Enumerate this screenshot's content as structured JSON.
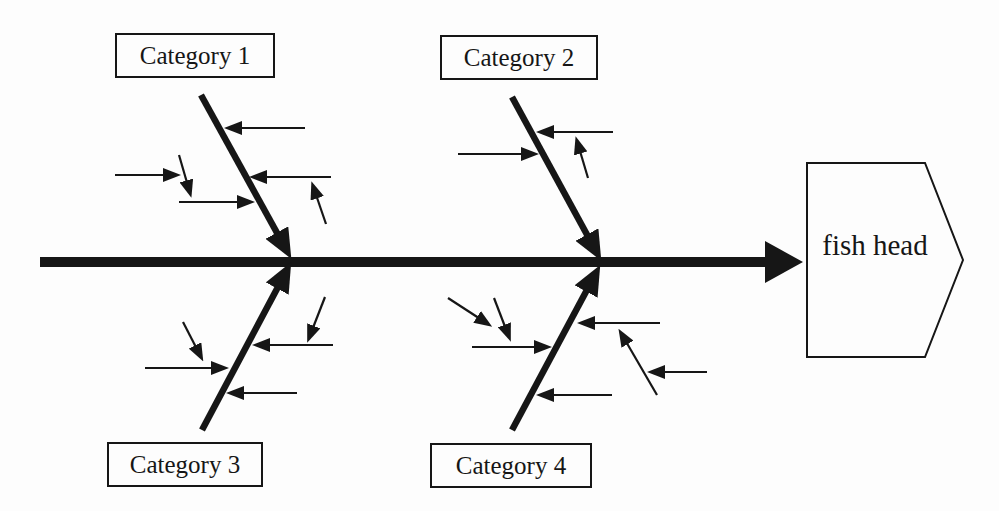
{
  "diagram": {
    "type": "fishbone-cause-and-effect",
    "head": {
      "label": "fish head"
    },
    "categories": [
      {
        "label": "Category 1",
        "position": "top-left",
        "sub_arrow_count": 6
      },
      {
        "label": "Category 2",
        "position": "top-right",
        "sub_arrow_count": 3
      },
      {
        "label": "Category 3",
        "position": "bottom-left",
        "sub_arrow_count": 5
      },
      {
        "label": "Category 4",
        "position": "bottom-right",
        "sub_arrow_count": 7
      }
    ],
    "colors": {
      "ink": "#161616",
      "bg": "#fdfdfd"
    }
  }
}
